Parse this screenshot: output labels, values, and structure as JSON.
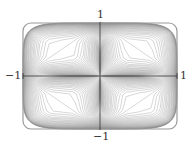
{
  "figure": {
    "line_color": "#8a8a8a",
    "axis_color": "#333333",
    "curve_count": 60,
    "x_range": [
      -1,
      1
    ],
    "y_range": [
      -1,
      1
    ]
  },
  "axes": {
    "top_label": "1",
    "bottom_label": "−1",
    "left_label": "−1",
    "right_label": "1"
  }
}
